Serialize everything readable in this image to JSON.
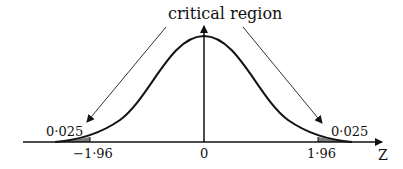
{
  "diagram": {
    "type": "standard-normal-distribution",
    "title_label": "critical region",
    "axis_label": "Z",
    "left_tail": {
      "critical_value_label": "−1·96",
      "area_label": "0·025",
      "critical_value": -1.96,
      "area": 0.025
    },
    "right_tail": {
      "critical_value_label": "1·96",
      "area_label": "0·025",
      "critical_value": 1.96,
      "area": 0.025
    },
    "center_label": "0",
    "colors": {
      "stroke": "#111111",
      "shade": "#7a7a7a",
      "arrow_line": "#333333"
    }
  }
}
